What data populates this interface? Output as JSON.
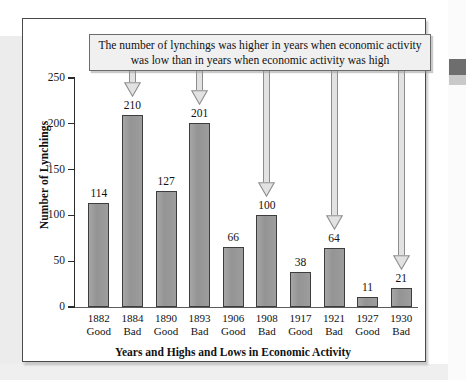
{
  "chart_data": {
    "type": "bar",
    "title": "",
    "xlabel": "Years and Highs and Lows in Economic Activity",
    "ylabel": "Number of Lynchings",
    "categories": [
      "1882",
      "1884",
      "1890",
      "1893",
      "1906",
      "1908",
      "1917",
      "1921",
      "1927",
      "1930"
    ],
    "category_conditions": [
      "Good",
      "Bad",
      "Good",
      "Bad",
      "Good",
      "Bad",
      "Good",
      "Bad",
      "Good",
      "Bad"
    ],
    "values": [
      114,
      210,
      127,
      201,
      66,
      100,
      38,
      64,
      11,
      21
    ],
    "ylim": [
      0,
      250
    ],
    "yticks": [
      0,
      50,
      100,
      150,
      200,
      250
    ],
    "ytick_labels": [
      "0",
      "50",
      "100",
      "150",
      "200",
      "250"
    ],
    "grid": false,
    "legend": null,
    "bar_color": "#9b9b9b",
    "bar_border_color": "#3d3d3d",
    "annotation": {
      "text_line1": "The number of lynchings was higher in years when economic activity",
      "text_line2": "was low than in years when economic activity was high",
      "points_to": [
        "1884",
        "1893",
        "1908",
        "1921",
        "1930"
      ],
      "box_fill": "#f0f0f0",
      "box_border": "#6b6b6b"
    }
  },
  "annotation_box": {
    "line1": "The number of lynchings was higher in years when economic activity",
    "line2": "was low than in years when economic activity was high"
  },
  "axes": {
    "y_title": "Number of Lynchings",
    "x_title": "Years and Highs and Lows in Economic Activity",
    "y_ticks": [
      "250",
      "200",
      "150",
      "100",
      "50",
      "0"
    ]
  },
  "bars": [
    {
      "year": "1882",
      "condition": "Good",
      "value": "114"
    },
    {
      "year": "1884",
      "condition": "Bad",
      "value": "210"
    },
    {
      "year": "1890",
      "condition": "Good",
      "value": "127"
    },
    {
      "year": "1893",
      "condition": "Bad",
      "value": "201"
    },
    {
      "year": "1906",
      "condition": "Good",
      "value": "66"
    },
    {
      "year": "1908",
      "condition": "Bad",
      "value": "100"
    },
    {
      "year": "1917",
      "condition": "Good",
      "value": "38"
    },
    {
      "year": "1921",
      "condition": "Bad",
      "value": "64"
    },
    {
      "year": "1927",
      "condition": "Good",
      "value": "11"
    },
    {
      "year": "1930",
      "condition": "Bad",
      "value": "21"
    }
  ]
}
